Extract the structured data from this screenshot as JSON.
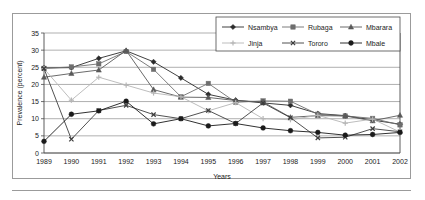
{
  "chart_data": {
    "type": "line",
    "title": "",
    "xlabel": "Years",
    "ylabel": "Prevalence (percent)",
    "categories": [
      "1989",
      "1990",
      "1991",
      "1992",
      "1993",
      "1994",
      "1995",
      "1996",
      "1997",
      "1998",
      "1999",
      "2000",
      "2001",
      "2002"
    ],
    "xlim": [
      1989,
      2002
    ],
    "ylim": [
      0,
      35
    ],
    "yticks": [
      0,
      5,
      10,
      15,
      20,
      25,
      30,
      35
    ],
    "grid": "horizontal",
    "legend_position": "top-right",
    "series": [
      {
        "name": "Nsambya",
        "marker": "diamond",
        "color": "#2b2b2b",
        "values": [
          24.8,
          24.9,
          27.6,
          29.8,
          26.6,
          21.9,
          17.1,
          15.4,
          14.6,
          13.9,
          11.5,
          10.9,
          9.6,
          8.4
        ]
      },
      {
        "name": "Rubaga",
        "marker": "square",
        "color": "#6e6e6e",
        "values": [
          24.7,
          25.1,
          26.0,
          29.6,
          24.4,
          16.4,
          20.3,
          14.8,
          15.2,
          15.1,
          11.3,
          10.8,
          10.1,
          8.2
        ]
      },
      {
        "name": "Mbarara",
        "marker": "triangle",
        "color": "#595959",
        "values": [
          22.1,
          23.2,
          24.2,
          29.9,
          18.5,
          16.3,
          16.2,
          15.3,
          14.9,
          10.4,
          10.9,
          10.8,
          9.4,
          11.0
        ]
      },
      {
        "name": "Jinja",
        "marker": "plus",
        "color": "#b5b5b5",
        "values": [
          24.6,
          15.4,
          22.1,
          19.8,
          17.5,
          16.4,
          12.3,
          14.7,
          10.0,
          9.7,
          11.0,
          8.7,
          9.9,
          6.1
        ]
      },
      {
        "name": "Tororo",
        "marker": "x",
        "color": "#3d3d3d",
        "values": [
          24.6,
          4.0,
          12.4,
          13.9,
          11.2,
          10.0,
          12.4,
          8.6,
          14.6,
          10.3,
          4.4,
          4.6,
          7.1,
          6.2
        ]
      },
      {
        "name": "Mbale",
        "marker": "circle",
        "color": "#1a1a1a",
        "values": [
          3.4,
          11.3,
          12.3,
          15.1,
          8.5,
          10.0,
          7.9,
          8.6,
          7.3,
          6.5,
          6.0,
          5.2,
          5.4,
          6.0
        ]
      }
    ],
    "legend": [
      {
        "label": "Nsambya",
        "marker": "diamond",
        "color": "#2b2b2b"
      },
      {
        "label": "Rubaga",
        "marker": "square",
        "color": "#6e6e6e"
      },
      {
        "label": "Mbarara",
        "marker": "triangle",
        "color": "#595959"
      },
      {
        "label": "Jinja",
        "marker": "plus",
        "color": "#b5b5b5"
      },
      {
        "label": "Tororo",
        "marker": "x",
        "color": "#3d3d3d"
      },
      {
        "label": "Mbale",
        "marker": "circle",
        "color": "#1a1a1a"
      }
    ]
  },
  "colors": {
    "frame": "#9b9b9b",
    "grid": "#8c8c8c",
    "axis": "#4a4a4a",
    "text": "#1a1a1a",
    "background": "#ffffff"
  }
}
